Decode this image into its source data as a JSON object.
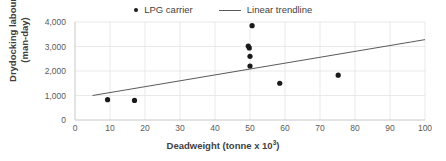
{
  "chart_data": {
    "type": "scatter",
    "title": "",
    "xlabel": "Deadweight (tonne x 10³)",
    "ylabel_line1": "Drydocking labour",
    "ylabel_line2": "(man-day)",
    "xlim": [
      0,
      100
    ],
    "ylim": [
      0,
      4000
    ],
    "xticks": [
      0,
      10,
      20,
      30,
      40,
      50,
      60,
      70,
      80,
      90,
      100
    ],
    "xtick_labels": [
      "0",
      "10",
      "20",
      "30",
      "40",
      "50",
      "60",
      "70",
      "80",
      "90",
      "100"
    ],
    "yticks": [
      0,
      1000,
      2000,
      3000,
      4000
    ],
    "ytick_labels": [
      "0",
      "1,000",
      "2,000",
      "3,000",
      "4,000"
    ],
    "grid": true,
    "legend_position": "top-center",
    "series": [
      {
        "name": "LPG carrier",
        "type": "scatter",
        "marker": "circle",
        "color": "#1a1a1a",
        "points": [
          {
            "x": 9.3,
            "y": 830
          },
          {
            "x": 17.0,
            "y": 800
          },
          {
            "x": 49.5,
            "y": 3020
          },
          {
            "x": 49.8,
            "y": 2940
          },
          {
            "x": 50.0,
            "y": 2600
          },
          {
            "x": 50.0,
            "y": 2200
          },
          {
            "x": 50.6,
            "y": 3850
          },
          {
            "x": 58.5,
            "y": 1500
          },
          {
            "x": 75.2,
            "y": 1830
          }
        ]
      },
      {
        "name": "Linear trendline",
        "type": "line",
        "color": "#5a5a5a",
        "points": [
          {
            "x": 5,
            "y": 1000
          },
          {
            "x": 100,
            "y": 3280
          }
        ]
      }
    ]
  },
  "legend": {
    "entries": [
      {
        "label": "LPG carrier",
        "marker": "dot"
      },
      {
        "label": "Linear trendline",
        "marker": "line"
      }
    ]
  },
  "axes": {
    "x_title_main": "Deadweight (tonne x 10",
    "x_title_sup": "3",
    "x_title_tail": ")",
    "y_title_line1": "Drydocking labour",
    "y_title_line2": "(man-day)"
  },
  "colors": {
    "marker": "#1a1a1a",
    "trendline": "#5a5a5a",
    "grid": "#e3e3e3",
    "axis": "#c8c8c8",
    "text": "#5a5a5a",
    "title_text": "#3f3f3f",
    "background": "#ffffff"
  }
}
